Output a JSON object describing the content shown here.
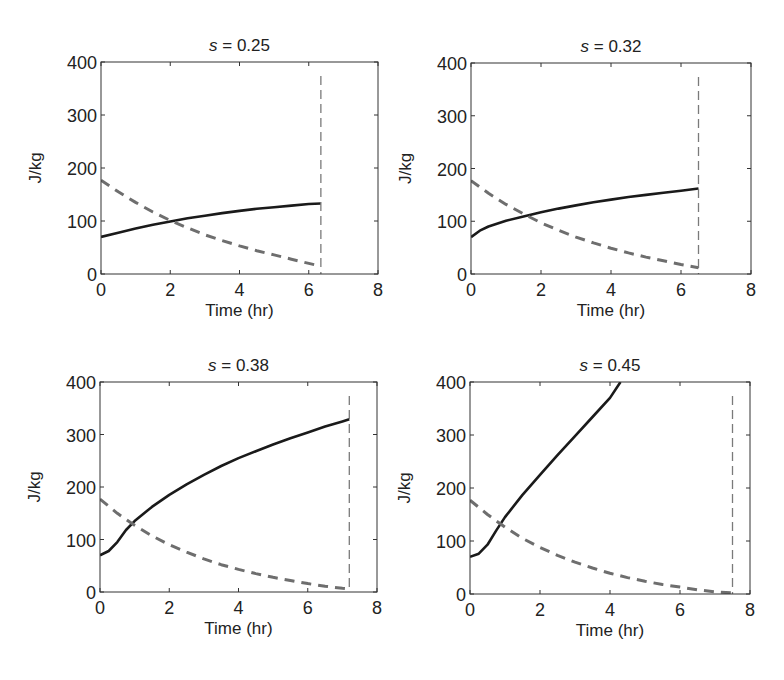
{
  "figure": {
    "width": 784,
    "height": 680,
    "colors": {
      "solid": "#1a1a1a",
      "dashed": "#6e6e6e",
      "vline": "#7a7a7a",
      "axes": "#333333"
    }
  },
  "chart_data": [
    {
      "type": "line",
      "title": "s = 0.25",
      "title_var": "s",
      "title_value": "= 0.25",
      "xlabel": "Time (hr)",
      "ylabel": "J/kg",
      "xlim": [
        0,
        8
      ],
      "ylim": [
        0,
        400
      ],
      "xticks": [
        "0",
        "2",
        "4",
        "6",
        "8"
      ],
      "yticks": [
        "0",
        "100",
        "200",
        "300",
        "400"
      ],
      "grid": false,
      "vline_x": 6.35,
      "series": [
        {
          "name": "solid",
          "style": "solid",
          "x": [
            0,
            0.5,
            1,
            1.5,
            2,
            2.5,
            3,
            3.5,
            4,
            4.5,
            5,
            5.5,
            6,
            6.35
          ],
          "y": [
            70,
            78,
            86,
            93,
            99,
            105,
            110,
            115,
            119,
            123,
            126,
            129,
            132,
            133
          ]
        },
        {
          "name": "dashed",
          "style": "dashed",
          "x": [
            0,
            0.5,
            1,
            1.5,
            2,
            2.5,
            3,
            3.5,
            4,
            4.5,
            5,
            5.5,
            6,
            6.35
          ],
          "y": [
            177,
            155,
            135,
            117,
            101,
            87,
            74,
            63,
            53,
            44,
            36,
            28,
            20,
            15
          ]
        }
      ]
    },
    {
      "type": "line",
      "title": "s = 0.32",
      "title_var": "s",
      "title_value": "= 0.32",
      "xlabel": "Time (hr)",
      "ylabel": "J/kg",
      "xlim": [
        0,
        8
      ],
      "ylim": [
        0,
        400
      ],
      "xticks": [
        "0",
        "2",
        "4",
        "6",
        "8"
      ],
      "yticks": [
        "0",
        "100",
        "200",
        "300",
        "400"
      ],
      "grid": false,
      "vline_x": 6.5,
      "series": [
        {
          "name": "solid",
          "style": "solid",
          "x": [
            0,
            0.25,
            0.5,
            1,
            1.5,
            2,
            2.5,
            3,
            3.5,
            4,
            4.5,
            5,
            5.5,
            6,
            6.5
          ],
          "y": [
            70,
            82,
            90,
            101,
            109,
            117,
            124,
            130,
            136,
            141,
            146,
            150,
            154,
            158,
            162
          ]
        },
        {
          "name": "dashed",
          "style": "dashed",
          "x": [
            0,
            0.5,
            1,
            1.5,
            2,
            2.5,
            3,
            3.5,
            4,
            4.5,
            5,
            5.5,
            6,
            6.5
          ],
          "y": [
            177,
            153,
            132,
            114,
            97,
            83,
            70,
            59,
            49,
            40,
            32,
            25,
            18,
            12
          ]
        }
      ]
    },
    {
      "type": "line",
      "title": "s = 0.38",
      "title_var": "s",
      "title_value": "= 0.38",
      "xlabel": "Time (hr)",
      "ylabel": "J/kg",
      "xlim": [
        0,
        8
      ],
      "ylim": [
        0,
        400
      ],
      "xticks": [
        "0",
        "2",
        "4",
        "6",
        "8"
      ],
      "yticks": [
        "0",
        "100",
        "200",
        "300",
        "400"
      ],
      "grid": false,
      "vline_x": 7.2,
      "series": [
        {
          "name": "solid",
          "style": "solid",
          "x": [
            0,
            0.25,
            0.5,
            0.75,
            1,
            1.5,
            2,
            2.5,
            3,
            3.5,
            4,
            4.5,
            5,
            5.5,
            6,
            6.5,
            7,
            7.2
          ],
          "y": [
            70,
            78,
            95,
            118,
            135,
            162,
            185,
            205,
            223,
            240,
            255,
            268,
            281,
            293,
            304,
            315,
            325,
            329
          ]
        },
        {
          "name": "dashed",
          "style": "dashed",
          "x": [
            0,
            0.5,
            1,
            1.5,
            2,
            2.5,
            3,
            3.5,
            4,
            4.5,
            5,
            5.5,
            6,
            6.5,
            7,
            7.2
          ],
          "y": [
            177,
            150,
            127,
            107,
            90,
            76,
            63,
            52,
            43,
            35,
            28,
            22,
            16,
            11,
            7,
            6
          ]
        }
      ]
    },
    {
      "type": "line",
      "title": "s = 0.45",
      "title_var": "s",
      "title_value": "= 0.45",
      "xlabel": "Time (hr)",
      "ylabel": "J/kg",
      "xlim": [
        0,
        8
      ],
      "ylim": [
        0,
        400
      ],
      "xticks": [
        "0",
        "2",
        "4",
        "6",
        "8"
      ],
      "yticks": [
        "0",
        "100",
        "200",
        "300",
        "400"
      ],
      "grid": false,
      "vline_x": 7.5,
      "series": [
        {
          "name": "solid",
          "style": "solid",
          "x": [
            0,
            0.25,
            0.5,
            0.75,
            1,
            1.5,
            2,
            2.5,
            3,
            3.5,
            4,
            4.3
          ],
          "y": [
            70,
            76,
            93,
            120,
            145,
            187,
            225,
            262,
            298,
            334,
            370,
            400
          ]
        },
        {
          "name": "dashed",
          "style": "dashed",
          "x": [
            0,
            0.5,
            1,
            1.5,
            2,
            2.5,
            3,
            3.5,
            4,
            4.5,
            5,
            5.5,
            6,
            6.5,
            7,
            7.5
          ],
          "y": [
            177,
            150,
            126,
            105,
            88,
            73,
            60,
            49,
            39,
            31,
            24,
            18,
            13,
            8,
            4,
            2
          ]
        }
      ]
    }
  ]
}
